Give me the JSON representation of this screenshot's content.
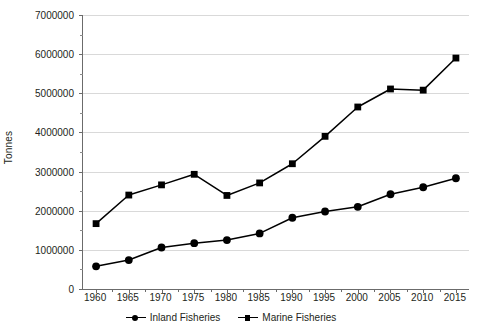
{
  "chart_data": {
    "type": "line",
    "title": "",
    "xlabel": "",
    "ylabel": "Tonnes",
    "x": [
      1960,
      1965,
      1970,
      1975,
      1980,
      1985,
      1990,
      1995,
      2000,
      2005,
      2010,
      2015
    ],
    "xtick_labels": [
      "1960",
      "1965",
      "1970",
      "1975",
      "1980",
      "1985",
      "1990",
      "1995",
      "2000",
      "2005",
      "2010",
      "2015"
    ],
    "ytick_labels": [
      "0",
      "1000000",
      "2000000",
      "3000000",
      "4000000",
      "5000000",
      "6000000",
      "7000000"
    ],
    "yticks": [
      0,
      1000000,
      2000000,
      3000000,
      4000000,
      5000000,
      6000000,
      7000000
    ],
    "ylim": [
      0,
      7000000
    ],
    "xlim": [
      1958,
      2017
    ],
    "grid": "horizontal",
    "legend_position": "bottom-center",
    "series": [
      {
        "name": "Inland Fisheries",
        "marker": "circle",
        "color": "#000000",
        "values": [
          580000,
          740000,
          1060000,
          1170000,
          1250000,
          1420000,
          1820000,
          1980000,
          2100000,
          2420000,
          2600000,
          2830000
        ]
      },
      {
        "name": "Marine Fisheries",
        "marker": "square",
        "color": "#000000",
        "values": [
          1670000,
          2400000,
          2660000,
          2930000,
          2390000,
          2710000,
          3200000,
          3900000,
          4650000,
          5110000,
          5080000,
          5900000
        ]
      }
    ]
  },
  "legend": {
    "entries": [
      {
        "label": "Inland Fisheries",
        "marker": "circle"
      },
      {
        "label": "Marine Fisheries",
        "marker": "square"
      }
    ]
  },
  "axes": {
    "y_title": "Tonnes"
  },
  "colors": {
    "series": "#000000",
    "gridline": "#d9d9d9",
    "axis": "#6b6b6b",
    "text": "#231f20",
    "background": "#ffffff"
  }
}
